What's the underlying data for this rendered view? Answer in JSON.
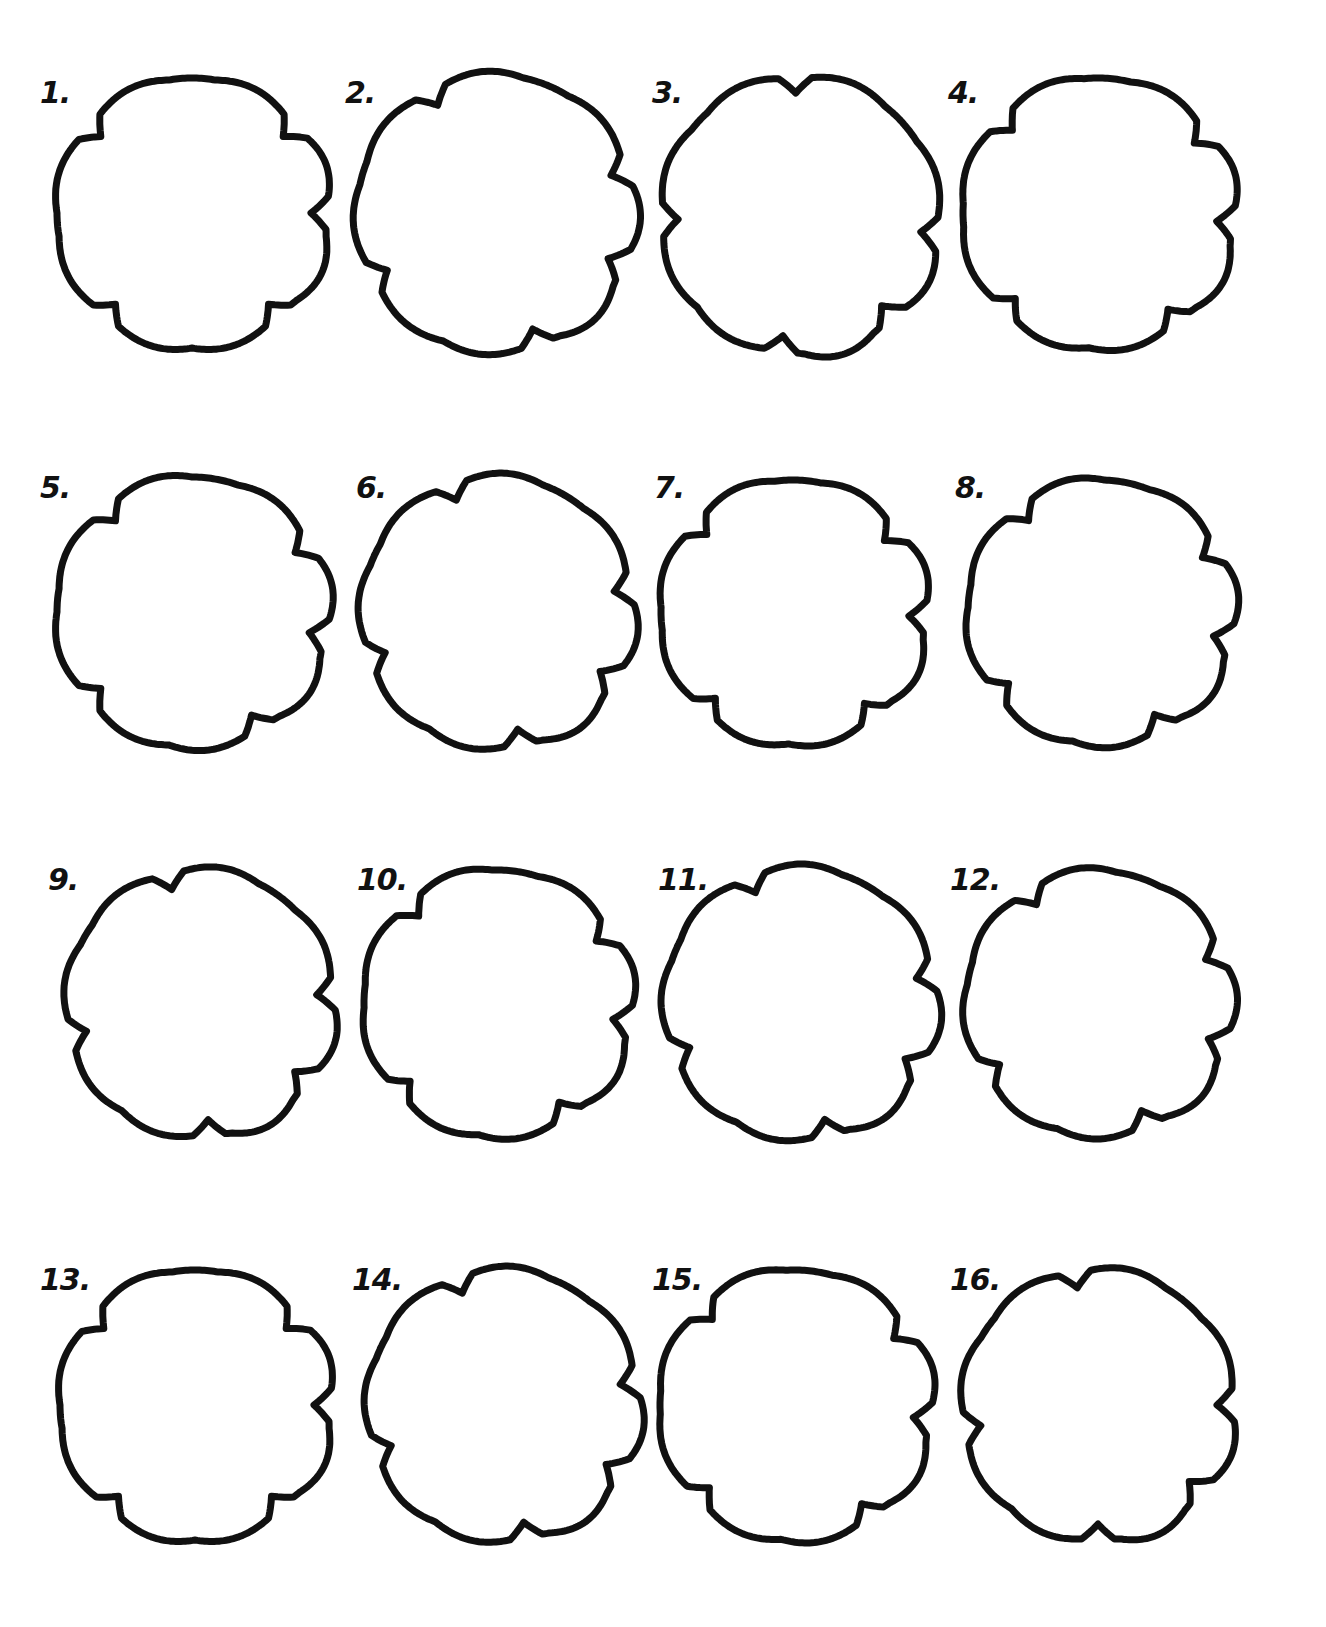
{
  "sheet": {
    "title": "Rotated five-notch shapes",
    "stroke_color": "#111111",
    "background": "#ffffff",
    "grid": {
      "rows": 4,
      "cols": 4
    }
  },
  "shapes": [
    {
      "label": "1.",
      "row": 0,
      "col": 0,
      "rotation": 0,
      "cx": 192,
      "cy": 213,
      "r": 135
    },
    {
      "label": "2.",
      "row": 0,
      "col": 1,
      "rotation": 22,
      "cx": 495,
      "cy": 213,
      "r": 138
    },
    {
      "label": "3.",
      "row": 0,
      "col": 2,
      "rotation": 48,
      "cx": 800,
      "cy": 215,
      "r": 138
    },
    {
      "label": "4.",
      "row": 0,
      "col": 3,
      "rotation": 4,
      "cx": 1098,
      "cy": 213,
      "r": 135
    },
    {
      "label": "5.",
      "row": 1,
      "col": 0,
      "rotation": 10,
      "cx": 192,
      "cy": 612,
      "r": 135
    },
    {
      "label": "6.",
      "row": 1,
      "col": 1,
      "rotation": 30,
      "cx": 497,
      "cy": 612,
      "r": 135
    },
    {
      "label": "7.",
      "row": 1,
      "col": 2,
      "rotation": 2,
      "cx": 793,
      "cy": 612,
      "r": 132
    },
    {
      "label": "8.",
      "row": 1,
      "col": 3,
      "rotation": 12,
      "cx": 1100,
      "cy": 612,
      "r": 132
    },
    {
      "label": "9.",
      "row": 2,
      "col": 0,
      "rotation": 36,
      "cx": 200,
      "cy": 1003,
      "r": 133
    },
    {
      "label": "10.",
      "row": 2,
      "col": 1,
      "rotation": 8,
      "cx": 497,
      "cy": 1003,
      "r": 133
    },
    {
      "label": "11.",
      "row": 2,
      "col": 2,
      "rotation": 28,
      "cx": 800,
      "cy": 1003,
      "r": 135
    },
    {
      "label": "12.",
      "row": 2,
      "col": 3,
      "rotation": 18,
      "cx": 1098,
      "cy": 1003,
      "r": 132
    },
    {
      "label": "13.",
      "row": 3,
      "col": 0,
      "rotation": 0,
      "cx": 195,
      "cy": 1405,
      "r": 135
    },
    {
      "label": "14.",
      "row": 3,
      "col": 1,
      "rotation": 30,
      "cx": 503,
      "cy": 1405,
      "r": 135
    },
    {
      "label": "15.",
      "row": 3,
      "col": 2,
      "rotation": 6,
      "cx": 795,
      "cy": 1405,
      "r": 135
    },
    {
      "label": "16.",
      "row": 3,
      "col": 3,
      "rotation": 40,
      "cx": 1098,
      "cy": 1405,
      "r": 135
    }
  ],
  "label_positions": [
    {
      "x": 40,
      "y": 75
    },
    {
      "x": 345,
      "y": 75
    },
    {
      "x": 652,
      "y": 75
    },
    {
      "x": 948,
      "y": 75
    },
    {
      "x": 40,
      "y": 470
    },
    {
      "x": 356,
      "y": 470
    },
    {
      "x": 654,
      "y": 470
    },
    {
      "x": 955,
      "y": 470
    },
    {
      "x": 48,
      "y": 862
    },
    {
      "x": 357,
      "y": 862
    },
    {
      "x": 658,
      "y": 862
    },
    {
      "x": 950,
      "y": 862
    },
    {
      "x": 40,
      "y": 1262
    },
    {
      "x": 352,
      "y": 1262
    },
    {
      "x": 652,
      "y": 1262
    },
    {
      "x": 950,
      "y": 1262
    }
  ]
}
